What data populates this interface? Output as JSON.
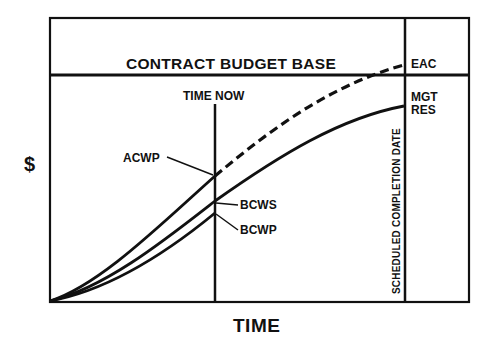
{
  "diagram": {
    "title": "CONTRACT BUDGET BASE",
    "y_axis_label": "$",
    "x_axis_label": "TIME",
    "markers": {
      "time_now": "TIME NOW",
      "scheduled_completion": "SCHEDULED COMPLETION DATE"
    },
    "right_panel": {
      "eac": "EAC",
      "mgt_res_line1": "MGT",
      "mgt_res_line2": "RES"
    },
    "curves": {
      "acwp": "ACWP",
      "bcws": "BCWS",
      "bcwp": "BCWP"
    },
    "colors": {
      "line": "#111111",
      "background": "#ffffff"
    }
  }
}
